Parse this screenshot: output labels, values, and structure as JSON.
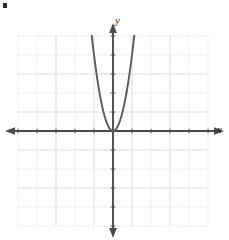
{
  "figure": {
    "kind": "coordinate-plane-graph",
    "corner_mark": "▪",
    "axes": {
      "x_label": "x",
      "y_label": "y"
    },
    "colors": {
      "axis": "#4a4a4a",
      "grid": "#cfcfcf",
      "grid_major": "#d6d6d6",
      "curve": "#5a5a5a",
      "background": "#ffffff",
      "corner_mark": "#2b2b2b"
    }
  },
  "chart_data": {
    "type": "line",
    "title": "",
    "xlabel": "x",
    "ylabel": "y",
    "xlim": [
      -5,
      5
    ],
    "ylim": [
      -5,
      5
    ],
    "grid": true,
    "legend": "none",
    "xticks": [
      -5,
      -4,
      -3,
      -2,
      -1,
      0,
      1,
      2,
      3,
      4,
      5
    ],
    "yticks": [
      -5,
      -4,
      -3,
      -2,
      -1,
      0,
      1,
      2,
      3,
      4,
      5
    ],
    "xtick_labels": [
      "",
      "",
      "",
      "",
      "",
      "",
      "",
      "",
      "",
      "",
      ""
    ],
    "ytick_labels": [
      "",
      "",
      "",
      "",
      "",
      "",
      "",
      "",
      "",
      "",
      ""
    ],
    "annotations": [],
    "series": [
      {
        "name": "y = 4x^2",
        "kind": "parabola",
        "vertex": [
          0,
          0
        ],
        "coefficient_a": 4,
        "opens": "up",
        "x": [
          -1.12,
          -1.05,
          -1.0,
          -0.95,
          -0.9,
          -0.85,
          -0.8,
          -0.75,
          -0.7,
          -0.65,
          -0.6,
          -0.55,
          -0.5,
          -0.45,
          -0.4,
          -0.35,
          -0.3,
          -0.25,
          -0.2,
          -0.15,
          -0.1,
          -0.05,
          0,
          0.05,
          0.1,
          0.15,
          0.2,
          0.25,
          0.3,
          0.35,
          0.4,
          0.45,
          0.5,
          0.55,
          0.6,
          0.65,
          0.7,
          0.75,
          0.8,
          0.85,
          0.9,
          0.95,
          1.0,
          1.05,
          1.12
        ],
        "y": [
          5.02,
          4.41,
          4.0,
          3.61,
          3.24,
          2.89,
          2.56,
          2.25,
          1.96,
          1.69,
          1.44,
          1.21,
          1.0,
          0.81,
          0.64,
          0.49,
          0.36,
          0.25,
          0.16,
          0.09,
          0.04,
          0.01,
          0,
          0.01,
          0.04,
          0.09,
          0.16,
          0.25,
          0.36,
          0.49,
          0.64,
          0.81,
          1.0,
          1.21,
          1.44,
          1.69,
          1.96,
          2.25,
          2.56,
          2.89,
          3.24,
          3.61,
          4.0,
          4.41,
          5.02
        ]
      }
    ]
  }
}
